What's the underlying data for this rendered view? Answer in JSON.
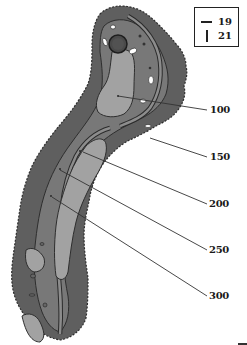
{
  "legend": {
    "items": [
      {
        "symbol": "horizontal-line",
        "value": "19"
      },
      {
        "symbol": "vertical-line",
        "value": "21"
      }
    ]
  },
  "distance_markers": [
    {
      "label": "100"
    },
    {
      "label": "150"
    },
    {
      "label": "200"
    },
    {
      "label": "250"
    },
    {
      "label": "300"
    }
  ],
  "colors": {
    "rough": "#5f5f5f",
    "rough_outline": "#3a3a3a",
    "semi_rough": "#7b7b7b",
    "fairway": "#a2a2a2",
    "green": "#4a4a4a",
    "path": "#8c8c8c",
    "bunker": "#ffffff",
    "line": "#333333"
  }
}
